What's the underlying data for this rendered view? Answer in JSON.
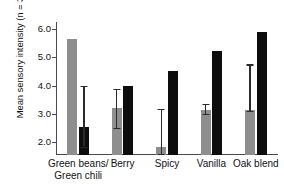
{
  "chart_data": {
    "type": "bar",
    "title": "",
    "xlabel": "",
    "ylabel": "Mean sensory intensity (n = 33)",
    "categories": [
      "Green beans/ Green chili",
      "Berry",
      "Spicy",
      "Vanilla",
      "Oak blend"
    ],
    "category_lines": [
      [
        "Green beans/",
        "Green chili"
      ],
      [
        "Berry",
        ""
      ],
      [
        "Spicy",
        ""
      ],
      [
        "Vanilla",
        ""
      ],
      [
        "Oak blend",
        ""
      ]
    ],
    "ylim": [
      1.55,
      6.25
    ],
    "yticks": [
      2.0,
      3.0,
      4.0,
      5.0,
      6.0
    ],
    "ytick_labels": [
      "2.0",
      "3.0",
      "4.0",
      "5.0",
      "6.0"
    ],
    "grid": false,
    "legend": "none",
    "series": [
      {
        "name": "gray",
        "color": "#8e8e8e",
        "values": [
          5.65,
          3.22,
          1.85,
          3.15,
          3.15
        ]
      },
      {
        "name": "black",
        "color": "#0d0d0d",
        "values": [
          2.55,
          3.98,
          4.52,
          5.22,
          5.9
        ]
      }
    ],
    "error_bars": [
      {
        "group": 0,
        "series": "black",
        "low": 1.85,
        "high": 4.0
      },
      {
        "group": 1,
        "series": "gray",
        "low": 2.52,
        "high": 3.9
      },
      {
        "group": 2,
        "series": "gray",
        "low": 1.6,
        "high": 3.17
      },
      {
        "group": 3,
        "series": "gray",
        "low": 3.0,
        "high": 3.35
      },
      {
        "group": 4,
        "series": "gray",
        "low": 3.12,
        "high": 4.75
      }
    ]
  },
  "colors": {
    "gray_bar": "#8e8e8e",
    "black_bar": "#0d0d0d",
    "axis": "#4a4a4a",
    "background": "#ffffff"
  }
}
